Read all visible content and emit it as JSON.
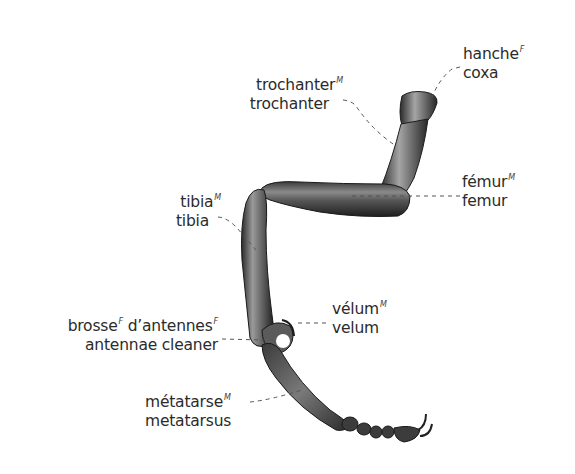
{
  "diagram": {
    "colors": {
      "text": "#2b2b2b",
      "leader": "#555555",
      "leg_dark": "#2a2a2a",
      "leg_mid": "#6e6e6e",
      "leg_light": "#bdbdbd",
      "background": "#ffffff"
    },
    "labels": [
      {
        "id": "coxa",
        "fr": "hanche",
        "gender": "F",
        "en": "coxa"
      },
      {
        "id": "trochanter",
        "fr": "trochanter",
        "gender": "M",
        "en": "trochanter"
      },
      {
        "id": "femur",
        "fr": "fémur",
        "gender": "M",
        "en": "femur"
      },
      {
        "id": "tibia",
        "fr": "tibia",
        "gender": "M",
        "en": "tibia"
      },
      {
        "id": "velum",
        "fr": "vélum",
        "gender": "M",
        "en": "velum"
      },
      {
        "id": "antennae_cleaner",
        "fr": "brosse",
        "gender": "F",
        "fr2": "d’antennes",
        "gender2": "F",
        "en": "antennae cleaner"
      },
      {
        "id": "metatarsus",
        "fr": "métatarse",
        "gender": "M",
        "en": "metatarsus"
      }
    ]
  }
}
